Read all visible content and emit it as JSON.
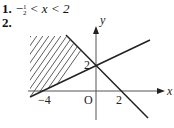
{
  "answers": [
    {
      "number": "1.",
      "prefix": "−",
      "frac_num": "1",
      "frac_den": "2",
      "rest": " < x < 2"
    },
    {
      "number": "2."
    }
  ],
  "graph": {
    "x_axis_label": "x",
    "y_axis_label": "y",
    "origin_label": "O",
    "tick_labels": {
      "x_neg4": "−4",
      "x_2": "2",
      "y_2": "2"
    },
    "lines": [
      {
        "name": "boundary-line-1",
        "passes_through": [
          [
            -4,
            0
          ],
          [
            0,
            2
          ]
        ]
      },
      {
        "name": "boundary-line-2",
        "passes_through": [
          [
            0,
            2
          ],
          [
            2,
            0
          ]
        ]
      }
    ],
    "shaded_region": "above line through (−4,0),(0,2) and left of line through (0,2),(2,0)"
  }
}
